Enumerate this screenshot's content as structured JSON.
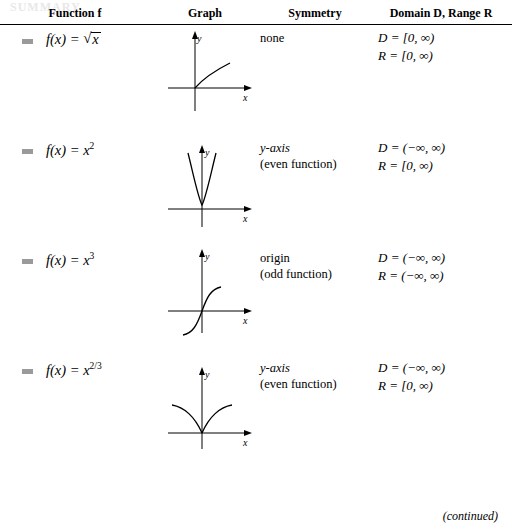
{
  "page": {
    "faint_header": "SUMMARY",
    "continued_note": "(continued)"
  },
  "table": {
    "headers": {
      "function": "Function f",
      "graph": "Graph",
      "symmetry": "Symmetry",
      "domain_range": "Domain D, Range R"
    },
    "rows": [
      {
        "function_label": "f(x) = √x",
        "function_prefix": "f(x) = ",
        "radicand": "x",
        "symmetry_line1": "none",
        "symmetry_line2": "",
        "domain": "D = [0, ∞)",
        "range": "R = [0, ∞)",
        "graph_name": "graph-sqrt-x",
        "axis_x_label": "x",
        "axis_y_label": "y"
      },
      {
        "function_label": "f(x) = x²",
        "function_prefix": "f(x) = ",
        "base": "x",
        "exponent": "2",
        "symmetry_line1": "y-axis",
        "symmetry_line2": "(even function)",
        "domain": "D = (−∞, ∞)",
        "range": "R = [0, ∞)",
        "graph_name": "graph-x-squared",
        "axis_x_label": "x",
        "axis_y_label": "y"
      },
      {
        "function_label": "f(x) = x³",
        "function_prefix": "f(x) = ",
        "base": "x",
        "exponent": "3",
        "symmetry_line1": "origin",
        "symmetry_line2": "(odd function)",
        "domain": "D = (−∞, ∞)",
        "range": "R = (−∞, ∞)",
        "graph_name": "graph-x-cubed",
        "axis_x_label": "x",
        "axis_y_label": "y"
      },
      {
        "function_label": "f(x) = x^(2/3)",
        "function_prefix": "f(x) = ",
        "base": "x",
        "exponent": "2/3",
        "symmetry_line1": "y-axis",
        "symmetry_line2": "(even function)",
        "domain": "D = (−∞, ∞)",
        "range": "R = [0, ∞)",
        "graph_name": "graph-x-two-thirds",
        "axis_x_label": "x",
        "axis_y_label": "y"
      }
    ]
  }
}
